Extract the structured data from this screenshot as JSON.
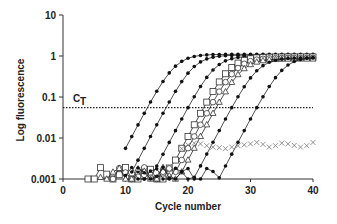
{
  "chart_data": {
    "type": "line",
    "title": "",
    "xlabel": "Cycle number",
    "ylabel": "Log fluorescence",
    "xlim": [
      0,
      40
    ],
    "ylim": [
      0.001,
      10
    ],
    "yscale": "log",
    "x_ticks": [
      0,
      10,
      20,
      30,
      40
    ],
    "x_tick_labels": [
      "0",
      "10",
      "20",
      "30",
      "40"
    ],
    "y_ticks": [
      0.001,
      0.01,
      0.1,
      1,
      10
    ],
    "y_tick_labels": [
      "0.001",
      "0.01",
      "0.1",
      "1",
      "10"
    ],
    "grid": false,
    "legend": "none",
    "threshold": {
      "label": "C",
      "label_sub": "T",
      "value": 0.055,
      "style": "dotted"
    },
    "series": [
      {
        "name": "sample-1",
        "marker": "filled-circle",
        "ct": 13.5,
        "plateau": 1.1,
        "start_cycle": 10
      },
      {
        "name": "sample-2",
        "marker": "filled-circle",
        "ct": 16.5,
        "plateau": 1.05,
        "start_cycle": 11
      },
      {
        "name": "sample-3",
        "marker": "filled-circle",
        "ct": 20,
        "plateau": 1.0,
        "start_cycle": 12
      },
      {
        "name": "sample-4",
        "marker": "open-square",
        "ct": 22.5,
        "plateau": 0.95,
        "start_cycle": 4
      },
      {
        "name": "sample-5",
        "marker": "open-circle",
        "ct": 23.5,
        "plateau": 0.9,
        "start_cycle": 8
      },
      {
        "name": "sample-6",
        "marker": "open-triangle",
        "ct": 24.5,
        "plateau": 0.85,
        "start_cycle": 6
      },
      {
        "name": "sample-7",
        "marker": "filled-circle",
        "ct": 27,
        "plateau": 0.9,
        "start_cycle": 10
      },
      {
        "name": "sample-8",
        "marker": "filled-circle",
        "ct": 31,
        "plateau": 0.95,
        "start_cycle": 12
      },
      {
        "name": "negative-control",
        "marker": "cross",
        "ct": null,
        "values_x": [
          19,
          20,
          21,
          22,
          23,
          24,
          25,
          26,
          27,
          28,
          29,
          30,
          31,
          32,
          33,
          34,
          35,
          36,
          37,
          38,
          39,
          40
        ],
        "values_y": [
          0.0055,
          0.0068,
          0.0075,
          0.0072,
          0.0065,
          0.006,
          0.0058,
          0.0055,
          0.006,
          0.0065,
          0.0068,
          0.0072,
          0.0078,
          0.007,
          0.006,
          0.0065,
          0.0075,
          0.0072,
          0.0066,
          0.006,
          0.0065,
          0.0078
        ]
      }
    ]
  }
}
